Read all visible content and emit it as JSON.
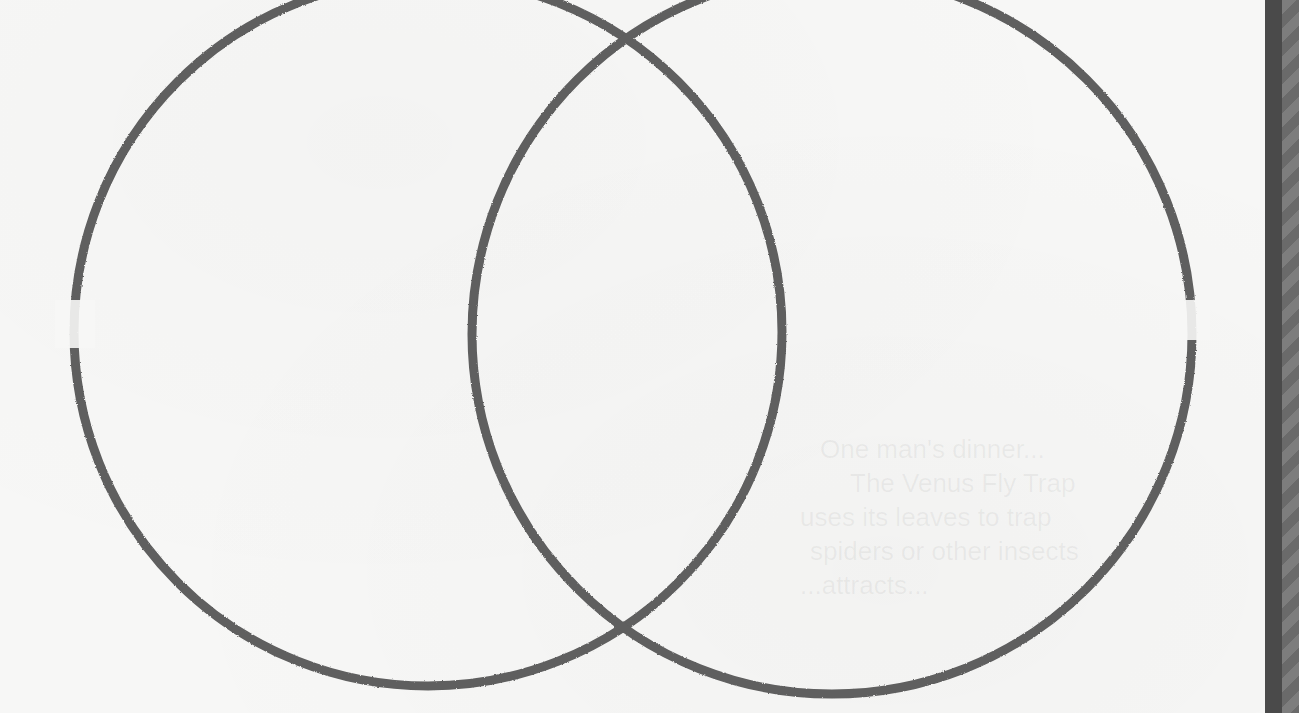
{
  "diagram": {
    "type": "venn",
    "sets": [
      {
        "name": "left-circle",
        "cx": 428,
        "cy": 332,
        "r": 354
      },
      {
        "name": "right-circle",
        "cx": 832,
        "cy": 334,
        "r": 360
      }
    ],
    "stroke_color": "#5e5e5e",
    "background_color": "#f7f7f6"
  },
  "bleed_through_text": [
    "One man's dinner...",
    "The Venus Fly Trap",
    "uses its leaves to trap",
    "spiders or other insects",
    "...attracts..."
  ],
  "frame": {
    "bar_color": "#4a4a4a",
    "stripe_colors": [
      "#7d7d7d",
      "#6a6a6a"
    ]
  }
}
